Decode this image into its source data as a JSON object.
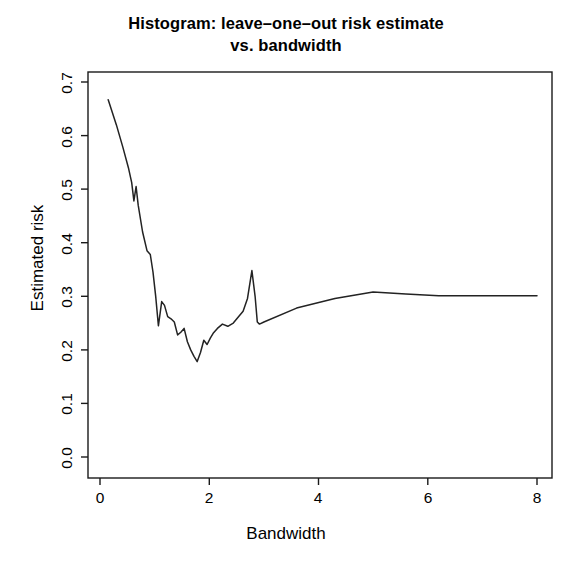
{
  "chart_data": {
    "type": "line",
    "title_lines": [
      "Histogram: leave–one–out risk estimate",
      "vs. bandwidth"
    ],
    "xlabel": "Bandwidth",
    "ylabel": "Estimated risk",
    "xlim": [
      -0.15,
      8.35
    ],
    "ylim": [
      -0.02,
      0.73
    ],
    "xticks": [
      0,
      2,
      4,
      6,
      8
    ],
    "xtick_labels": [
      "0",
      "2",
      "4",
      "6",
      "8"
    ],
    "yticks": [
      0.0,
      0.1,
      0.2,
      0.3,
      0.4,
      0.5,
      0.6,
      0.7
    ],
    "ytick_labels": [
      "0.0",
      "0.1",
      "0.2",
      "0.3",
      "0.4",
      "0.5",
      "0.6",
      "0.7"
    ],
    "grid": false,
    "legend": false,
    "line_color": "#232323",
    "frame_color": "#1a1a1a",
    "background": "#ffffff",
    "series": [
      {
        "name": "leave-one-out risk estimate",
        "x": [
          0.15,
          0.3,
          0.42,
          0.52,
          0.58,
          0.62,
          0.66,
          0.7,
          0.78,
          0.86,
          0.92,
          0.97,
          1.02,
          1.07,
          1.13,
          1.18,
          1.24,
          1.3,
          1.36,
          1.42,
          1.48,
          1.54,
          1.6,
          1.66,
          1.72,
          1.78,
          1.84,
          1.9,
          1.96,
          2.02,
          2.08,
          2.15,
          2.24,
          2.34,
          2.44,
          2.54,
          2.62,
          2.7,
          2.78,
          2.84,
          2.88,
          2.92,
          3.0,
          3.6,
          4.3,
          5.0,
          5.6,
          6.2,
          7.0,
          8.0
        ],
        "y": [
          0.667,
          0.62,
          0.578,
          0.54,
          0.512,
          0.478,
          0.505,
          0.47,
          0.42,
          0.385,
          0.378,
          0.345,
          0.3,
          0.245,
          0.29,
          0.283,
          0.262,
          0.258,
          0.252,
          0.228,
          0.233,
          0.24,
          0.215,
          0.2,
          0.188,
          0.178,
          0.195,
          0.218,
          0.21,
          0.222,
          0.232,
          0.24,
          0.248,
          0.244,
          0.25,
          0.262,
          0.272,
          0.296,
          0.348,
          0.3,
          0.252,
          0.248,
          0.252,
          0.278,
          0.296,
          0.308,
          0.304,
          0.301,
          0.301,
          0.301
        ]
      }
    ],
    "annotations": {
      "minimum": {
        "x": 1.8,
        "y": 0.178
      },
      "spike": {
        "x": 2.8,
        "y": 0.348
      },
      "local_peak": {
        "x": 5.0,
        "y": 0.308
      },
      "start": {
        "x": 0.15,
        "y": 0.667
      },
      "plateau": {
        "x": 8.0,
        "y": 0.301
      }
    }
  }
}
